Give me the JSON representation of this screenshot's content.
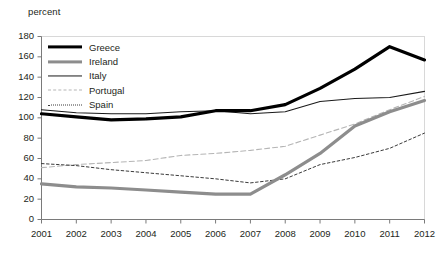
{
  "unit_label": "percent",
  "legend": {
    "position": "top-left-inside",
    "entries": [
      {
        "label": "Greece",
        "color": "#000000",
        "width": 3.2,
        "style": "solid"
      },
      {
        "label": "Ireland",
        "color": "#8d8d8d",
        "width": 3.2,
        "style": "solid"
      },
      {
        "label": "Italy",
        "color": "#1a1a1a",
        "width": 1.1,
        "style": "solid"
      },
      {
        "label": "Portugal",
        "color": "#b5b5b5",
        "width": 1.1,
        "style": "dashed"
      },
      {
        "label": "Spain",
        "color": "#3b3b3b",
        "width": 1.0,
        "style": "dotted"
      }
    ]
  },
  "axes": {
    "y_ticks": [
      "180",
      "160",
      "140",
      "120",
      "100",
      "80",
      "60",
      "40",
      "20",
      "0"
    ],
    "x_ticks": [
      "2001",
      "2002",
      "2003",
      "2004",
      "2005",
      "2006",
      "2007",
      "2008",
      "2009",
      "2010",
      "2011",
      "2012"
    ]
  },
  "chart_data": {
    "type": "line",
    "title": "",
    "xlabel": "",
    "ylabel": "percent",
    "ylim": [
      0,
      180
    ],
    "ytick_step": 20,
    "grid": false,
    "legend_position": "top-left-inside",
    "x": [
      2001,
      2002,
      2003,
      2004,
      2005,
      2006,
      2007,
      2008,
      2009,
      2010,
      2011,
      2012
    ],
    "categories": [
      "2001",
      "2002",
      "2003",
      "2004",
      "2005",
      "2006",
      "2007",
      "2008",
      "2009",
      "2010",
      "2011",
      "2012"
    ],
    "series": [
      {
        "name": "Greece",
        "color": "#000000",
        "line_width": 3.2,
        "line_style": "solid",
        "values": [
          104,
          101,
          98,
          99,
          101,
          107,
          107,
          113,
          129,
          148,
          170,
          157
        ]
      },
      {
        "name": "Ireland",
        "color": "#8d8d8d",
        "line_width": 3.2,
        "line_style": "solid",
        "values": [
          35,
          32,
          31,
          29,
          27,
          25,
          25,
          44,
          65,
          92,
          106,
          117
        ]
      },
      {
        "name": "Italy",
        "color": "#1a1a1a",
        "line_width": 1.1,
        "line_style": "solid",
        "values": [
          108,
          105,
          104,
          104,
          106,
          107,
          104,
          106,
          116,
          119,
          120,
          126
        ]
      },
      {
        "name": "Portugal",
        "color": "#b5b5b5",
        "line_width": 1.1,
        "line_style": "dashed",
        "values": [
          51,
          54,
          56,
          58,
          63,
          65,
          68,
          72,
          83,
          94,
          108,
          121
        ]
      },
      {
        "name": "Spain",
        "color": "#3b3b3b",
        "line_width": 1.0,
        "line_style": "dotted",
        "values": [
          55,
          53,
          49,
          46,
          43,
          40,
          36,
          40,
          54,
          61,
          70,
          85
        ]
      }
    ]
  }
}
